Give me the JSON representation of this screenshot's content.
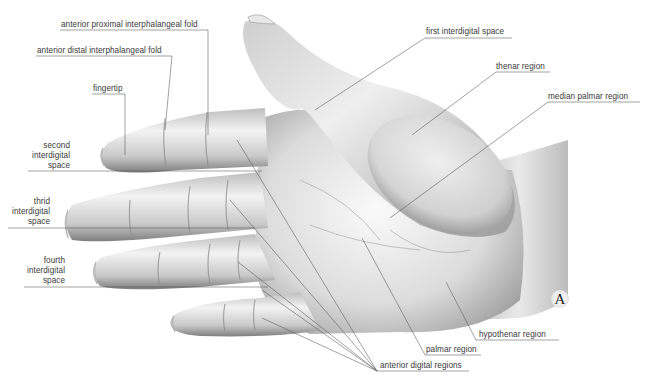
{
  "figure": {
    "plate_letter": "A"
  },
  "labels": {
    "anterior_proximal_interphalangeal_fold": "anterior proximal interphalangeal fold",
    "anterior_distal_interphalangeal_fold": "anterior distal interphalangeal fold",
    "fingertip": "fingertip",
    "second_interdigital_space": [
      "second",
      "interdigital",
      "space"
    ],
    "third_interdigital_space": [
      "thrid",
      "interdigital",
      "space"
    ],
    "fourth_interdigital_space": [
      "fourth",
      "interdigital",
      "space"
    ],
    "first_interdigital_space": "first interdigital space",
    "thenar_region": "thenar region",
    "median_palmar_region": "median palmar region",
    "hypothenar_region": "hypothenar region",
    "palmar_region": "palmar region",
    "anterior_digital_regions": "anterior digital regions"
  },
  "colors": {
    "background": "#ffffff",
    "skin_light": "#f4f4f4",
    "skin_mid": "#c8c8c8",
    "skin_dark": "#8a8a8a",
    "leader_line": "#555555",
    "label_text": "#3a3a3a"
  }
}
